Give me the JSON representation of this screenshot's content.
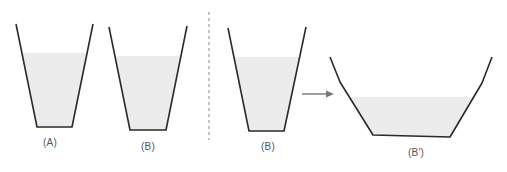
{
  "figure": {
    "colors": {
      "outline": "#2a2a2a",
      "fill": "#ececec",
      "divider": "#888888",
      "arrow": "#777777",
      "label": "#555555"
    },
    "containers": [
      {
        "id": "A",
        "label": "(A)",
        "shape": "trapezoid",
        "outline": [
          [
            16,
            24
          ],
          [
            37,
            127
          ],
          [
            72,
            127
          ],
          [
            93,
            24
          ]
        ],
        "fill_top_y": 53,
        "label_pos": [
          50,
          137
        ]
      },
      {
        "id": "B",
        "label": "(B)",
        "shape": "trapezoid",
        "outline": [
          [
            109,
            27
          ],
          [
            130,
            130
          ],
          [
            166,
            130
          ],
          [
            187,
            26
          ]
        ],
        "fill_top_y": 56,
        "label_pos": [
          148,
          141
        ]
      },
      {
        "id": "B-copy",
        "label": "(B)",
        "shape": "trapezoid",
        "outline": [
          [
            228,
            28
          ],
          [
            249,
            131
          ],
          [
            284,
            131
          ],
          [
            306,
            27
          ]
        ],
        "fill_top_y": 57,
        "label_pos": [
          268,
          141
        ]
      },
      {
        "id": "B-prime",
        "label": "(B')",
        "shape": "widened trapezoid",
        "outline": [
          [
            330,
            57
          ],
          [
            340,
            82
          ],
          [
            373,
            135
          ],
          [
            450,
            137
          ],
          [
            482,
            83
          ],
          [
            492,
            57
          ]
        ],
        "fill_top_y": 97,
        "label_pos": [
          416,
          147
        ]
      }
    ],
    "divider": {
      "style": "dashed",
      "x": 209,
      "y1": 12,
      "y2": 140
    },
    "arrow": {
      "from": [
        302,
        94
      ],
      "to": [
        334,
        94
      ],
      "meaning": "B transforms into B'"
    }
  }
}
